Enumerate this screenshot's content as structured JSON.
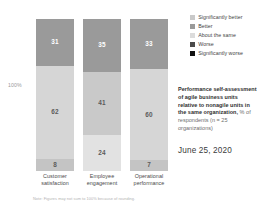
{
  "chart_data": {
    "type": "bar",
    "subtype": "stacked-bar-100",
    "title": "Performance self-assessment of agile business units relative to nonagile units in the same organization, % of respondents (n = 25 organizations)",
    "xlabel": "",
    "ylabel": "",
    "ylim": [
      0,
      100
    ],
    "axis_tick_labels": [
      "100%"
    ],
    "grid": false,
    "legend_position": "top-right",
    "categories": [
      "Customer satisfaction",
      "Employee engagement",
      "Operational performance"
    ],
    "series": [
      {
        "name": "Significantly better",
        "color": "#c9c9c9",
        "values": [
          null,
          null,
          null
        ]
      },
      {
        "name": "Better",
        "color": "#9a9a9a",
        "values": [
          31,
          35,
          33
        ]
      },
      {
        "name": "About the same",
        "color": "#d6d6d6",
        "values": [
          62,
          41,
          60
        ]
      },
      {
        "name": "Worse",
        "color": "#4a4a4a",
        "values": [
          8,
          24,
          7
        ]
      },
      {
        "name": "Significantly worse",
        "color": "#111111",
        "values": [
          null,
          null,
          null
        ]
      }
    ],
    "bars": [
      {
        "category": "Customer satisfaction",
        "segments": [
          {
            "label": "31",
            "value": 31,
            "series": "Better",
            "color": "#9a9a9a",
            "text_color": "light"
          },
          {
            "label": "62",
            "value": 62,
            "series": "About the same",
            "color": "#d6d6d6",
            "text_color": "dark"
          },
          {
            "label": "8",
            "value": 8,
            "series": "Worse",
            "color": "#c4c4c4",
            "text_color": "dark"
          }
        ]
      },
      {
        "category": "Employee engagement",
        "segments": [
          {
            "label": "35",
            "value": 35,
            "series": "Better",
            "color": "#9a9a9a",
            "text_color": "light"
          },
          {
            "label": "41",
            "value": 41,
            "series": "About the same",
            "color": "#c9c9c9",
            "text_color": "dark"
          },
          {
            "label": "24",
            "value": 24,
            "series": "Worse",
            "color": "#e2e2e2",
            "text_color": "dark"
          }
        ]
      },
      {
        "category": "Operational performance",
        "segments": [
          {
            "label": "33",
            "value": 33,
            "series": "Better",
            "color": "#9a9a9a",
            "text_color": "light"
          },
          {
            "label": "60",
            "value": 60,
            "series": "About the same",
            "color": "#d6d6d6",
            "text_color": "dark"
          },
          {
            "label": "7",
            "value": 7,
            "series": "Worse",
            "color": "#c4c4c4",
            "text_color": "dark"
          }
        ]
      }
    ],
    "footnote": "Note: Figures may not sum to 100% because of rounding."
  },
  "axis": {
    "y_top_label": "100%"
  },
  "legend": {
    "items": [
      {
        "label": "Significantly better",
        "color": "#c9c9c9"
      },
      {
        "label": "Better",
        "color": "#9a9a9a"
      },
      {
        "label": "About the same",
        "color": "#dcdcdc"
      },
      {
        "label": "Worse",
        "color": "#4a4a4a"
      },
      {
        "label": "Significantly worse",
        "color": "#111111"
      }
    ]
  },
  "blurb": {
    "bold_text": "Performance self-assessment of agile business units relative to nonagile units in the same organization,",
    "normal_text": " % of respondents (n = 25 organizations)"
  },
  "date": "June 25, 2020",
  "footnote": "Note: Figures may not sum to 100% because of rounding.",
  "categories": [
    {
      "label": "Customer satisfaction"
    },
    {
      "label": "Employee engagement"
    },
    {
      "label": "Operational performance"
    }
  ]
}
